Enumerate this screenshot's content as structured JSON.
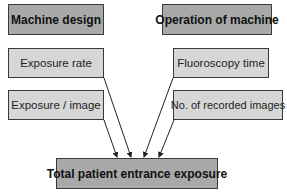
{
  "diagram": {
    "type": "flow",
    "nodes": [
      {
        "id": "machine_design",
        "label": "Machine design",
        "style": "header"
      },
      {
        "id": "operation_of_machine",
        "label": "Operation of machine",
        "style": "header"
      },
      {
        "id": "exposure_rate",
        "label": "Exposure rate",
        "style": "factor"
      },
      {
        "id": "fluoroscopy_time",
        "label": "Fluoroscopy time",
        "style": "factor"
      },
      {
        "id": "exposure_per_image",
        "label": "Exposure / image",
        "style": "factor"
      },
      {
        "id": "recorded_images",
        "label": "No. of recorded images",
        "style": "factor"
      },
      {
        "id": "total",
        "label": "Total patient entrance exposure",
        "style": "result"
      }
    ],
    "edges": [
      {
        "from": "exposure_rate",
        "to": "total"
      },
      {
        "from": "exposure_per_image",
        "to": "total"
      },
      {
        "from": "fluoroscopy_time",
        "to": "total"
      },
      {
        "from": "recorded_images",
        "to": "total"
      }
    ],
    "colors": {
      "header_fill": "#a9a9a9",
      "factor_fill": "#d6d6d6",
      "border": "#3a3a3a"
    }
  }
}
